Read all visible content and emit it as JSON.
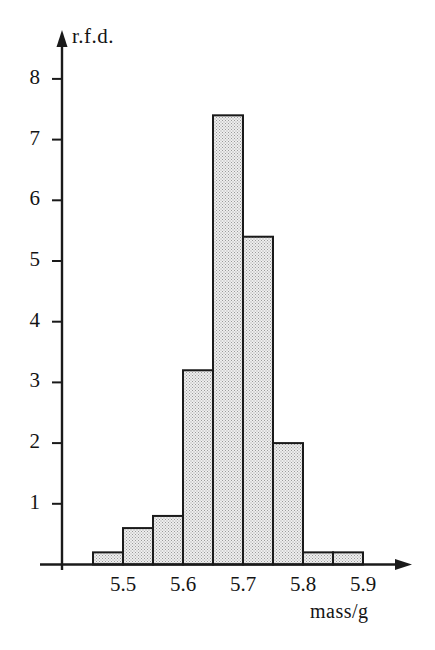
{
  "chart_data": {
    "type": "bar",
    "title": "",
    "subtitle": "",
    "xlabel": "mass/g",
    "ylabel": "r.f.d.",
    "grid": false,
    "legend": null,
    "bin_width": 0.05,
    "xlim": [
      5.42,
      5.95
    ],
    "ylim": [
      0,
      8.6
    ],
    "x_tick_labels": [
      "5.5",
      "5.6",
      "5.7",
      "5.8",
      "5.9"
    ],
    "x_tick_values": [
      5.5,
      5.6,
      5.7,
      5.8,
      5.9
    ],
    "y_tick_labels": [
      "1",
      "2",
      "3",
      "4",
      "5",
      "6",
      "7",
      "8"
    ],
    "y_tick_values": [
      1,
      2,
      3,
      4,
      5,
      6,
      7,
      8
    ],
    "bin_edges": [
      5.45,
      5.5,
      5.55,
      5.6,
      5.65,
      5.7,
      5.75,
      5.8,
      5.85,
      5.9
    ],
    "categories": [
      "5.45-5.50",
      "5.50-5.55",
      "5.55-5.60",
      "5.60-5.65",
      "5.65-5.70",
      "5.70-5.75",
      "5.75-5.80",
      "5.80-5.85",
      "5.85-5.90"
    ],
    "values": [
      0.2,
      0.6,
      0.8,
      3.2,
      7.4,
      5.4,
      2.0,
      0.2,
      0.2
    ],
    "bar_fill_color": "#e3e3e3",
    "bar_edge_color": "#1a1a1a",
    "axis_color": "#1a1a1a",
    "background_color": "#ffffff",
    "bar_fill_pattern": "stipple-dots"
  }
}
